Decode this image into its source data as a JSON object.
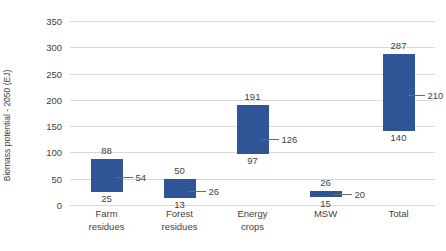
{
  "chart_data": {
    "type": "bar",
    "subtype": "floating-range-bar",
    "title": "",
    "xlabel": "",
    "ylabel": "Biomass potential - 2050 (EJ)",
    "ylim": [
      0,
      350
    ],
    "ytick_step": 50,
    "yticks": [
      0,
      50,
      100,
      150,
      200,
      250,
      300,
      350
    ],
    "ytick_labels": [
      "0",
      "50",
      "100",
      "150",
      "200",
      "250",
      "300",
      "350"
    ],
    "grid": true,
    "legend": "none",
    "categories": [
      "Farm residues",
      "Forest residues",
      "Energy crops",
      "MSW",
      "Total"
    ],
    "category_lines": [
      [
        "Farm",
        "residues"
      ],
      [
        "Forest",
        "residues"
      ],
      [
        "Energy",
        "crops"
      ],
      [
        "MSW",
        ""
      ],
      [
        "Total",
        ""
      ]
    ],
    "series": [
      {
        "name": "low",
        "values": [
          25,
          13,
          97,
          15,
          140
        ]
      },
      {
        "name": "mid",
        "values": [
          54,
          26,
          126,
          20,
          210
        ]
      },
      {
        "name": "high",
        "values": [
          88,
          50,
          191,
          26,
          287
        ]
      }
    ],
    "bars": [
      {
        "category": "Farm residues",
        "low": 25,
        "mid": 54,
        "high": 88,
        "low_label": "25",
        "mid_label": "54",
        "high_label": "88"
      },
      {
        "category": "Forest residues",
        "low": 13,
        "mid": 26,
        "high": 50,
        "low_label": "13",
        "mid_label": "26",
        "high_label": "50"
      },
      {
        "category": "Energy crops",
        "low": 97,
        "mid": 126,
        "high": 191,
        "low_label": "97",
        "mid_label": "126",
        "high_label": "191"
      },
      {
        "category": "MSW",
        "low": 15,
        "mid": 20,
        "high": 26,
        "low_label": "15",
        "mid_label": "20",
        "high_label": "26"
      },
      {
        "category": "Total",
        "low": 140,
        "mid": 210,
        "high": 287,
        "low_label": "140",
        "mid_label": "210",
        "high_label": "287"
      }
    ],
    "colors": {
      "bar_fill": "#2f5597",
      "gridline": "#d9d9d9",
      "text": "#3f3f3f",
      "leader_line": "#6b6b6b",
      "background": "#ffffff"
    }
  }
}
